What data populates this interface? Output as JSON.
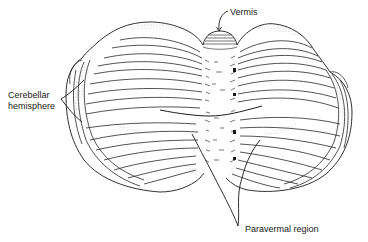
{
  "figure": {
    "labels": {
      "vermis": "Vermis",
      "hemisphere_line1": "Cerebellar",
      "hemisphere_line2": "hemisphere",
      "paravermal": "Paravermal region"
    },
    "colors": {
      "ink": "#1a1a1a",
      "shade": "#9a9a9a",
      "background": "#ffffff"
    }
  }
}
